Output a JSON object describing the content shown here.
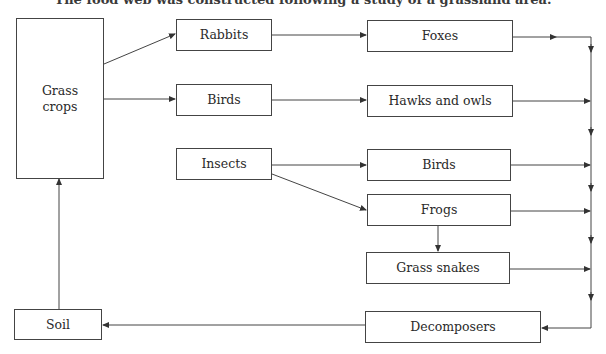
{
  "caption": "The food web was constructed following a study of a grassland area.",
  "nodes": {
    "grass": {
      "label": "Grass\ncrops",
      "line1": "Grass",
      "line2": "crops"
    },
    "rabbits": {
      "label": "Rabbits"
    },
    "birds_primary": {
      "label": "Birds"
    },
    "insects": {
      "label": "Insects"
    },
    "foxes": {
      "label": "Foxes"
    },
    "hawks_owls": {
      "label": "Hawks and owls"
    },
    "birds_secondary": {
      "label": "Birds"
    },
    "frogs": {
      "label": "Frogs"
    },
    "grass_snakes": {
      "label": "Grass snakes"
    },
    "decomposers": {
      "label": "Decomposers"
    },
    "soil": {
      "label": "Soil"
    }
  },
  "edges": [
    {
      "from": "Grass crops",
      "to": "Rabbits"
    },
    {
      "from": "Grass crops",
      "to": "Birds"
    },
    {
      "from": "Rabbits",
      "to": "Foxes"
    },
    {
      "from": "Birds",
      "to": "Hawks and owls"
    },
    {
      "from": "Insects",
      "to": "Birds"
    },
    {
      "from": "Insects",
      "to": "Frogs"
    },
    {
      "from": "Frogs",
      "to": "Grass snakes"
    },
    {
      "from": "Foxes",
      "to": "Decomposers"
    },
    {
      "from": "Hawks and owls",
      "to": "Decomposers"
    },
    {
      "from": "Birds",
      "to": "Decomposers"
    },
    {
      "from": "Frogs",
      "to": "Decomposers"
    },
    {
      "from": "Grass snakes",
      "to": "Decomposers"
    },
    {
      "from": "Decomposers",
      "to": "Soil"
    },
    {
      "from": "Soil",
      "to": "Grass crops"
    }
  ],
  "colors": {
    "line": "#444444",
    "text": "#2a2a2a",
    "background": "#ffffff"
  }
}
